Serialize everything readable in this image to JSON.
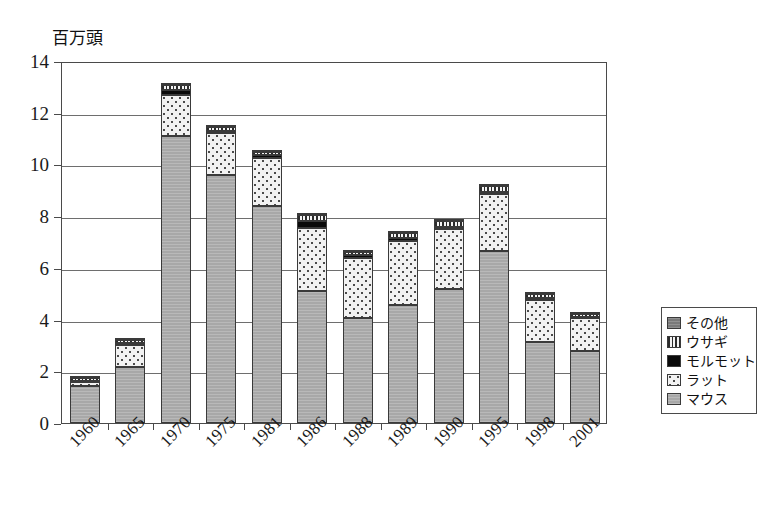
{
  "chart_data": {
    "type": "bar",
    "stacked": true,
    "title": "",
    "subtitle": "",
    "xlabel": "",
    "ylabel": "百万頭",
    "ylim": [
      0,
      14
    ],
    "ytick_step": 2,
    "yticks": [
      "0",
      "2",
      "4",
      "6",
      "8",
      "10",
      "12",
      "14"
    ],
    "grid": true,
    "legend_position": "right",
    "categories": [
      "1960",
      "1965",
      "1970",
      "1975",
      "1981",
      "1986",
      "1988",
      "1989",
      "1990",
      "1995",
      "1998",
      "2001"
    ],
    "series": [
      {
        "name": "マウス",
        "key": "mouse",
        "pattern": "solid-gray",
        "values": [
          1.45,
          2.15,
          11.1,
          9.6,
          8.4,
          5.1,
          4.05,
          4.55,
          5.2,
          6.65,
          3.15,
          2.8
        ]
      },
      {
        "name": "ラット",
        "key": "rat",
        "pattern": "dotted-light",
        "values": [
          0.12,
          0.85,
          1.6,
          1.6,
          1.85,
          2.45,
          2.35,
          2.5,
          2.3,
          2.2,
          1.6,
          1.25
        ]
      },
      {
        "name": "モルモット",
        "key": "guinea-pig",
        "pattern": "solid-black",
        "values": [
          0.07,
          0.08,
          0.18,
          0.1,
          0.1,
          0.28,
          0.08,
          0.1,
          0.1,
          0.1,
          0.08,
          0.05
        ]
      },
      {
        "name": "ウサギ",
        "key": "rabbit",
        "pattern": "vertical-stripes",
        "values": [
          0.1,
          0.12,
          0.2,
          0.15,
          0.15,
          0.22,
          0.12,
          0.18,
          0.2,
          0.2,
          0.15,
          0.1
        ]
      },
      {
        "name": "その他",
        "key": "other",
        "pattern": "solid-dark-gray",
        "values": [
          0.03,
          0.05,
          0.07,
          0.05,
          0.05,
          0.05,
          0.05,
          0.05,
          0.05,
          0.05,
          0.05,
          0.03
        ]
      }
    ],
    "totals": [
      1.77,
      3.25,
      13.15,
      11.5,
      10.55,
      8.1,
      6.65,
      7.38,
      7.85,
      9.2,
      5.03,
      4.23
    ]
  },
  "legend": {
    "items": [
      {
        "label": "その他",
        "swatch": "solid-dark-gray"
      },
      {
        "label": "ウサギ",
        "swatch": "vertical-stripes"
      },
      {
        "label": "モルモット",
        "swatch": "solid-black"
      },
      {
        "label": "ラット",
        "swatch": "dotted-light"
      },
      {
        "label": "マウス",
        "swatch": "solid-gray"
      }
    ]
  },
  "colors": {
    "mouse": "#a8a8a8",
    "rat": "#f2f2f2",
    "guinea_pig": "#0a0a0a",
    "rabbit": "#e8e8e8",
    "other": "#7a7a7a",
    "frame": "#4a4a4a",
    "grid": "#6e6e6e",
    "text": "#1a1a1a",
    "background": "#ffffff"
  }
}
